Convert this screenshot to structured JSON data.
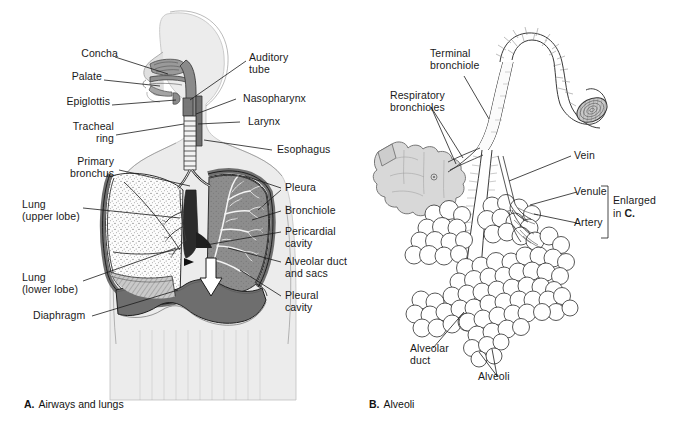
{
  "figure": {
    "panels": [
      {
        "id": "A",
        "letter": "A.",
        "caption": "Airways and lungs",
        "labels": [
          {
            "key": "concha",
            "text": "Concha"
          },
          {
            "key": "palate",
            "text": "Palate"
          },
          {
            "key": "epiglottis",
            "text": "Epiglottis"
          },
          {
            "key": "tracheal_ring",
            "text": "Tracheal\nring"
          },
          {
            "key": "primary_bronchus",
            "text": "Primary\nbronchus"
          },
          {
            "key": "lung_upper",
            "text": "Lung\n(upper lobe)"
          },
          {
            "key": "lung_lower",
            "text": "Lung\n(lower lobe)"
          },
          {
            "key": "diaphragm",
            "text": "Diaphragm"
          },
          {
            "key": "auditory_tube",
            "text": "Auditory\ntube"
          },
          {
            "key": "nasopharynx",
            "text": "Nasopharynx"
          },
          {
            "key": "larynx",
            "text": "Larynx"
          },
          {
            "key": "esophagus",
            "text": "Esophagus"
          },
          {
            "key": "pleura",
            "text": "Pleura"
          },
          {
            "key": "bronchiole",
            "text": "Bronchiole"
          },
          {
            "key": "pericardial_cavity",
            "text": "Pericardial\ncavity"
          },
          {
            "key": "alveolar_duct_sacs",
            "text": "Alveolar duct\nand sacs"
          },
          {
            "key": "pleural_cavity",
            "text": "Pleural\ncavity"
          }
        ]
      },
      {
        "id": "B",
        "letter": "B.",
        "caption": "Alveoli",
        "labels": [
          {
            "key": "terminal_bronchiole",
            "text": "Terminal\nbronchiole"
          },
          {
            "key": "respiratory_bronchioles",
            "text": "Respiratory\nbronchioles"
          },
          {
            "key": "vein",
            "text": "Vein"
          },
          {
            "key": "venule",
            "text": "Venule"
          },
          {
            "key": "artery",
            "text": "Artery"
          },
          {
            "key": "alveolar_duct",
            "text": "Alveolar\nduct"
          },
          {
            "key": "alveoli",
            "text": "Alveoli"
          }
        ],
        "bracket_note": {
          "line1": "Enlarged",
          "line2_prefix": "in ",
          "line2_bold": "C."
        }
      }
    ],
    "colors": {
      "body_silhouette": "#ececec",
      "body_outline": "#b3b3b3",
      "airway_gray": "#8a8a8a",
      "pleura_gray": "#707070",
      "diaphragm_gray": "#6e6e6e",
      "lung_dark": "#8d8d8d",
      "lung_stipple_bg": "#fcfcfc",
      "line": "#1a1a1a",
      "sac_gray": "#d8d8d8"
    }
  }
}
